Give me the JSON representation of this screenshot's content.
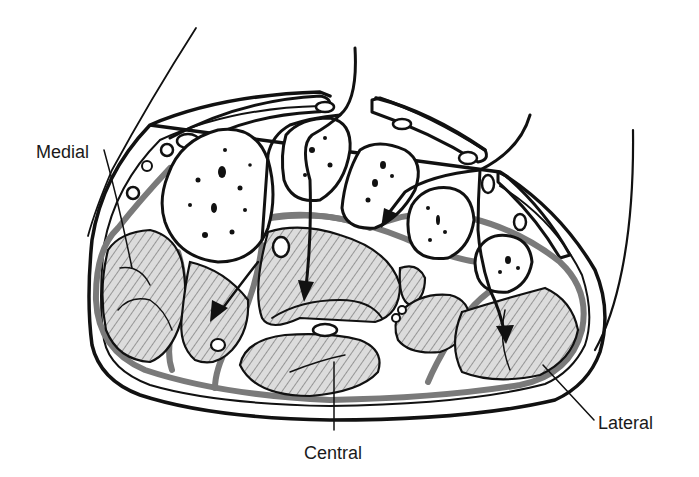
{
  "figure": {
    "labels": [
      {
        "id": "medial",
        "text": "Medial",
        "x": 36,
        "y": 143
      },
      {
        "id": "central",
        "text": "Central",
        "x": 304,
        "y": 444
      },
      {
        "id": "lateral",
        "text": "Lateral",
        "x": 598,
        "y": 414
      }
    ],
    "colors": {
      "ink": "#111111",
      "fascia": "#7a7a7a",
      "muscle_fill": "#dcdcdc",
      "background": "#ffffff"
    }
  }
}
